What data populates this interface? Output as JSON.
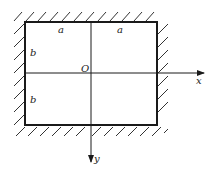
{
  "diagram": {
    "labels": {
      "top_left_half": "a",
      "top_right_half": "a",
      "left_upper_half": "b",
      "left_lower_half": "b",
      "origin": "O",
      "x_axis": "x",
      "y_axis": "y"
    },
    "colors": {
      "line": "#1a1a1a",
      "hatch": "#333333",
      "background": "#ffffff"
    }
  }
}
